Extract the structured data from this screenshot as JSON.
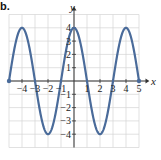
{
  "figure": {
    "problem_label": "b."
  },
  "chart_data": {
    "type": "line",
    "title": "",
    "xlabel": "x",
    "ylabel": "y",
    "xlim": [
      -5,
      5
    ],
    "ylim": [
      -4,
      4
    ],
    "grid": true,
    "x_ticks": [
      -4,
      -3,
      -2,
      -1,
      1,
      2,
      3,
      4,
      5
    ],
    "x_tick_labels": [
      "-4",
      "-3",
      "-2",
      "-1",
      "1",
      "2",
      "3",
      "4",
      "5"
    ],
    "y_ticks": [
      4,
      3,
      2,
      1,
      -1,
      -2,
      -3,
      -4
    ],
    "y_tick_labels": [
      "4",
      "3",
      "2",
      "1",
      "-1",
      "-2",
      "-3",
      "-4"
    ],
    "function": "y = 4cos(pi*x/2)",
    "series": [
      {
        "name": "curve",
        "color": "#4a6b9a",
        "x": [
          -5,
          -4.5,
          -4,
          -3.5,
          -3,
          -2.5,
          -2,
          -1.5,
          -1,
          -0.5,
          0,
          0.5,
          1,
          1.5,
          2,
          2.5,
          3,
          3.5,
          4,
          4.5,
          5
        ],
        "y": [
          0,
          2.83,
          4,
          2.83,
          0,
          -2.83,
          -4,
          -2.83,
          0,
          2.83,
          4,
          2.83,
          0,
          -2.83,
          -4,
          -2.83,
          0,
          2.83,
          4,
          2.83,
          0
        ]
      }
    ],
    "endpoints": [
      {
        "x": -5,
        "y": 0,
        "marker": "filled-dot"
      },
      {
        "x": 5,
        "y": 0,
        "marker": "filled-dot"
      }
    ],
    "colors": {
      "curve": "#4a6b9a",
      "grid": "#d4d4d4",
      "axis": "#333333"
    }
  }
}
